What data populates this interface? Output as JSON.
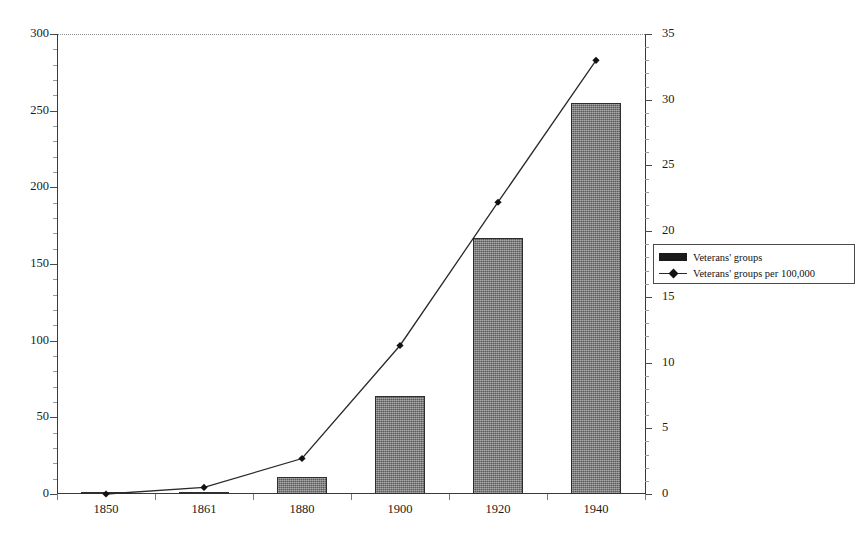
{
  "chart_data": {
    "type": "bar",
    "title": "",
    "subtitle": "",
    "xlabel": "",
    "ylabel": "",
    "categories": [
      "1850",
      "1861",
      "1880",
      "1900",
      "1920",
      "1940"
    ],
    "grid": false,
    "legend_position": "right",
    "series": [
      {
        "name": "Veterans' groups",
        "type": "bar",
        "axis": "left",
        "values": [
          0,
          1,
          11,
          64,
          167,
          255
        ]
      },
      {
        "name": "Veterans' groups per 100,000",
        "type": "line",
        "axis": "right",
        "values": [
          0,
          0.5,
          2.7,
          11.3,
          22.2,
          33
        ]
      }
    ],
    "left_axis": {
      "label": "",
      "ylim": [
        0,
        300
      ],
      "ticks": [
        0,
        50,
        100,
        150,
        200,
        250,
        300
      ],
      "tick_labels": [
        "0",
        "50",
        "100",
        "150",
        "200",
        "250",
        "300"
      ],
      "minor_step": 10
    },
    "right_axis": {
      "label": "",
      "ylim": [
        0,
        35
      ],
      "ticks": [
        0,
        5,
        10,
        15,
        20,
        25,
        30,
        35
      ],
      "tick_labels": [
        "0",
        "5",
        "10",
        "15",
        "20",
        "25",
        "30",
        "35"
      ],
      "minor_step": 1
    },
    "legend": [
      {
        "label": "Veterans' groups",
        "marker": "bar-swatch-icon",
        "color": "#1b1b1b"
      },
      {
        "label": "Veterans' groups per 100,000",
        "marker": "line-diamond-icon",
        "color": "#2a2a2a"
      }
    ],
    "colors": {
      "bar_fill": "#5b5b5b",
      "bar_border": "#2e2e2e",
      "line": "#2a2a2a",
      "marker": "#121212",
      "axis": "#3a3a3a",
      "background": "#ffffff"
    }
  }
}
